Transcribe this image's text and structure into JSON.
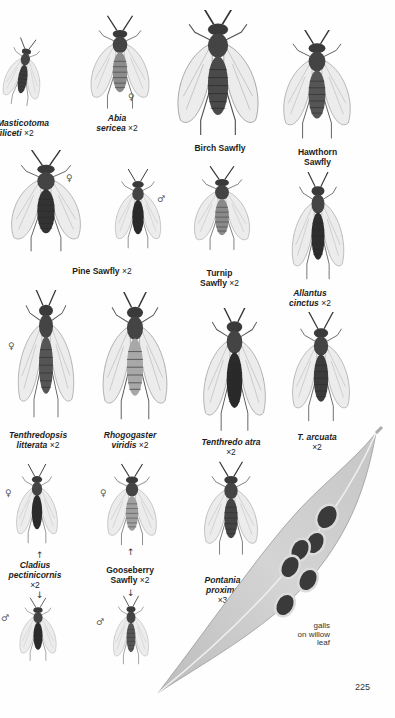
{
  "page": {
    "number": "225",
    "colors": {
      "background": "#fefefe",
      "ink": "#1c1c1c",
      "wing": "#e9e9e9",
      "body_dark": "#2b2b2b",
      "body_light": "#9a9a9a",
      "leaf": "#c9c9c9",
      "gall": "#3a3a3a"
    }
  },
  "specimens": [
    {
      "id": "masticotoma",
      "name_line1": "Masticotoma",
      "name_line2": "filiceti",
      "magnification": "×2",
      "italic": true
    },
    {
      "id": "abia",
      "name_line1": "Abia",
      "name_line2": "sericea",
      "magnification": "×2",
      "italic": true,
      "sex": "♀"
    },
    {
      "id": "birch",
      "name_line1": "Birch Sawfly",
      "name_line2": "",
      "magnification": "",
      "italic": false
    },
    {
      "id": "hawthorn",
      "name_line1": "Hawthorn",
      "name_line2": "Sawfly",
      "magnification": "",
      "italic": false
    },
    {
      "id": "pine",
      "name_line1": "Pine Sawfly",
      "name_line2": "",
      "magnification": "×2",
      "italic": false,
      "sex_female": "♀",
      "sex_male": "♂"
    },
    {
      "id": "turnip",
      "name_line1": "Turnip",
      "name_line2": "Sawfly",
      "magnification": "×2",
      "italic": false
    },
    {
      "id": "allantus",
      "name_line1": "Allantus",
      "name_line2": "cinctus",
      "magnification": "×2",
      "italic": true
    },
    {
      "id": "tenthredopsis",
      "name_line1": "Tenthredopsis",
      "name_line2": "litterata",
      "magnification": "×2",
      "italic": true,
      "sex": "♀"
    },
    {
      "id": "rhogogaster",
      "name_line1": "Rhogogaster",
      "name_line2": "viridis",
      "magnification": "×2",
      "italic": true
    },
    {
      "id": "tenthredo_atra",
      "name_line1": "Tenthredo atra",
      "name_line2": "",
      "magnification": "×2",
      "italic": true
    },
    {
      "id": "t_arcuata",
      "name_line1": "T. arcuata",
      "name_line2": "",
      "magnification": "×2",
      "italic": true
    },
    {
      "id": "cladius",
      "name_line1": "Cladius",
      "name_line2": "pectinicornis",
      "magnification": "×2",
      "italic": true,
      "sex_female": "♀",
      "sex_male": "♂"
    },
    {
      "id": "gooseberry",
      "name_line1": "Gooseberry",
      "name_line2": "Sawfly",
      "magnification": "×2",
      "italic": false,
      "sex_female": "♀",
      "sex_male": "♂"
    },
    {
      "id": "pontania",
      "name_line1": "Pontania",
      "name_line2": "proxima",
      "magnification": "×3",
      "italic": true
    }
  ],
  "annotations": {
    "galls_line1": "galls",
    "galls_line2": "on willow",
    "galls_line3": "leaf",
    "arrow_right": "→",
    "arrow_up": "↑",
    "arrow_down": "↓"
  }
}
